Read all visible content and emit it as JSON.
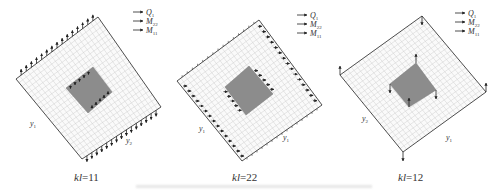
{
  "panels": [
    {
      "label": "kl=11",
      "label_italic": "kl",
      "label_value": "=11",
      "plate": {
        "top": [
          98,
          17
        ],
        "right": [
          161,
          107
        ],
        "bottom": [
          82,
          159
        ],
        "left": [
          16,
          79
        ]
      },
      "patch": {
        "top": [
          93,
          67
        ],
        "right": [
          112,
          92
        ],
        "bottom": [
          88,
          113
        ],
        "left": [
          66,
          88
        ]
      },
      "axis_y1": {
        "text": "y",
        "sub": "1",
        "x": 30,
        "y": 126
      },
      "axis_y2": {
        "text": "y",
        "sub": "2",
        "x": 126,
        "y": 143
      },
      "legend": {
        "x": 133,
        "y": 12
      },
      "arrows": "ticks-normal-out-edge1-edge3",
      "grid_n": 22
    },
    {
      "label": "kl=22",
      "label_italic": "kl",
      "label_value": "=22",
      "plate": {
        "top": [
          259,
          20
        ],
        "right": [
          322,
          105
        ],
        "bottom": [
          242,
          161
        ],
        "left": [
          177,
          81
        ]
      },
      "patch": {
        "top": [
          249,
          66
        ],
        "right": [
          273,
          94
        ],
        "bottom": [
          246,
          115
        ],
        "left": [
          225,
          87
        ]
      },
      "axis_y1": {
        "text": "y",
        "sub": "1",
        "x": 199,
        "y": 131
      },
      "axis_y2": {
        "text": "y",
        "sub": "1",
        "x": 283,
        "y": 140
      },
      "legend": {
        "x": 297,
        "y": 15
      },
      "arrows": "ticks-inplane-edge2-edge4",
      "grid_n": 22
    },
    {
      "label": "kl=12",
      "label_italic": "kl",
      "label_value": "=12",
      "plate": {
        "top": [
          422,
          16
        ],
        "right": [
          486,
          92
        ],
        "bottom": [
          403,
          152
        ],
        "left": [
          340,
          75
        ]
      },
      "patch": {
        "top": [
          416,
          63
        ],
        "right": [
          436,
          90
        ],
        "bottom": [
          409,
          107
        ],
        "left": [
          390,
          84
        ]
      },
      "axis_y1": {
        "text": "y",
        "sub": "2",
        "x": 362,
        "y": 121
      },
      "axis_y2": {
        "text": "y",
        "sub": "1",
        "x": 446,
        "y": 140
      },
      "legend": {
        "x": 455,
        "y": 13
      },
      "arrows": "corner-forces",
      "grid_n": 22
    }
  ],
  "legend_items": [
    {
      "symbol": "Q",
      "sub": "1"
    },
    {
      "symbol": "M",
      "sub": "22"
    },
    {
      "symbol": "M",
      "sub": "11"
    }
  ],
  "colors": {
    "plate_edge": "#3a3a3a",
    "grid": "#cfcfcf",
    "patch": "#8c8c8c",
    "arrow": "#222222",
    "text": "#333333"
  }
}
